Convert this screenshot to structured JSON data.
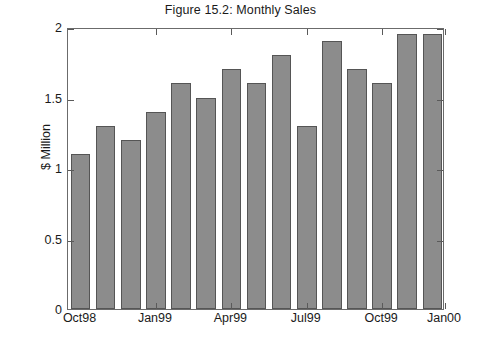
{
  "chart_data": {
    "type": "bar",
    "title": "Figure 15.2: Monthly Sales",
    "xlabel": "",
    "ylabel": "$ Million",
    "ylim": [
      0,
      2
    ],
    "yticks": [
      0,
      0.5,
      1,
      1.5,
      2
    ],
    "ytick_labels": [
      "0",
      "0.5",
      "1",
      "1.5",
      "2"
    ],
    "grid": false,
    "legend": null,
    "categories": [
      "Oct98",
      "Nov98",
      "Dec98",
      "Jan99",
      "Feb99",
      "Mar99",
      "Apr99",
      "May99",
      "Jun99",
      "Jul99",
      "Aug99",
      "Sep99",
      "Oct99",
      "Nov99",
      "Dec99"
    ],
    "values": [
      1.1,
      1.3,
      1.2,
      1.4,
      1.6,
      1.5,
      1.7,
      1.6,
      1.8,
      1.3,
      1.9,
      1.7,
      1.6,
      1.95,
      1.95
    ],
    "xtick_labels": [
      "Oct98",
      "Jan99",
      "Apr99",
      "Jul99",
      "Oct99",
      "Jan00"
    ],
    "bar_color": "#8c8c8c",
    "bar_edge_color": "#555555",
    "axis_color": "#6b6b6b",
    "background_color": "#ffffff"
  },
  "figure": {
    "title": "Figure 15.2: Monthly Sales"
  }
}
